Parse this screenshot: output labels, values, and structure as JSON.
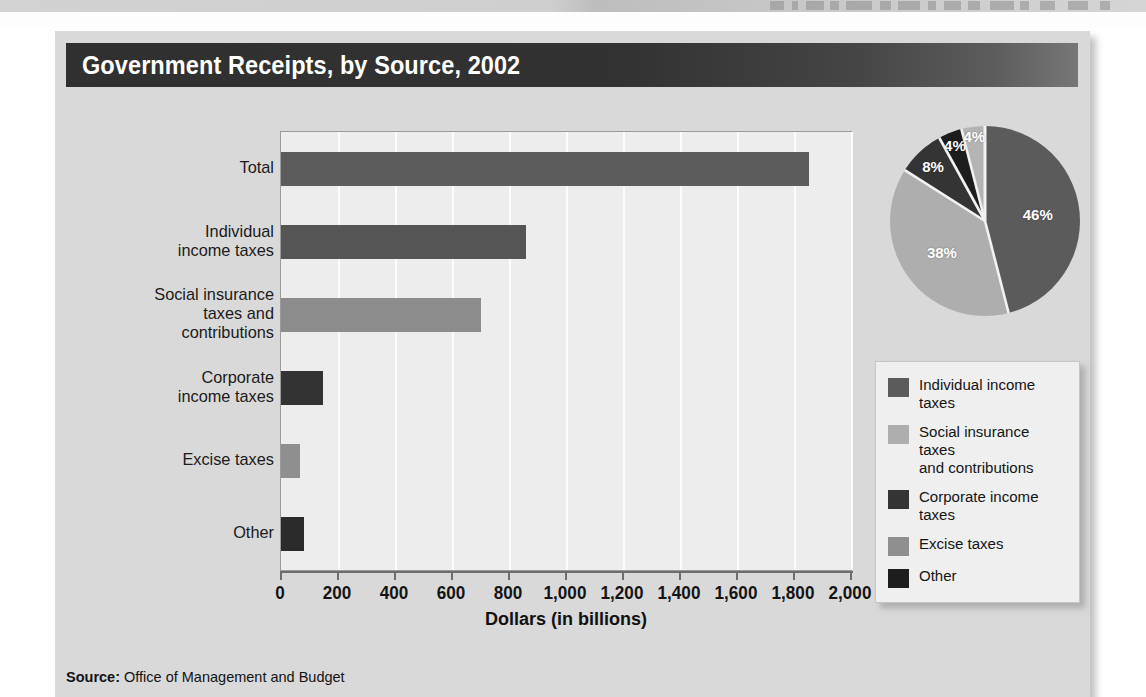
{
  "figure": {
    "title": "Government Receipts, by Source, 2002",
    "source_label": "Source:",
    "source_text": "Office of Management and Budget"
  },
  "chart_data": [
    {
      "type": "bar",
      "orientation": "horizontal",
      "title": "Government Receipts, by Source, 2002",
      "xlabel": "Dollars (in billions)",
      "ylabel": "",
      "xlim": [
        0,
        2000
      ],
      "xticks": [
        0,
        200,
        400,
        600,
        800,
        1000,
        1200,
        1400,
        1600,
        1800,
        2000
      ],
      "xticklabels": [
        "0",
        "200",
        "400",
        "600",
        "800",
        "1,000",
        "1,200",
        "1,400",
        "1,600",
        "1,800",
        "2,000"
      ],
      "grid": true,
      "categories": [
        "Total",
        "Individual\nincome taxes",
        "Social insurance\ntaxes and\ncontributions",
        "Corporate\nincome taxes",
        "Excise taxes",
        "Other"
      ],
      "values": [
        1853,
        858,
        701,
        148,
        67,
        79
      ],
      "colors": [
        "#5c5c5c",
        "#555555",
        "#8c8c8c",
        "#333333",
        "#8f8f8f",
        "#2b2b2b"
      ]
    },
    {
      "type": "pie",
      "title": "",
      "labels": [
        "Individual income taxes",
        "Social insurance taxes and contributions",
        "Corporate income taxes",
        "Other",
        "Excise taxes"
      ],
      "values": [
        46,
        38,
        8,
        4,
        4
      ],
      "datalabels": [
        "46%",
        "38%",
        "8%",
        "4%",
        "4%"
      ],
      "colors": [
        "#5b5b5b",
        "#aeaeae",
        "#343434",
        "#1d1d1d",
        "#b4b4b4"
      ],
      "startangle": 90,
      "counterclock": false
    }
  ],
  "legend": {
    "position": "right",
    "entries": [
      {
        "label": "Individual income taxes",
        "color": "#5b5b5b"
      },
      {
        "label": "Social insurance taxes\nand contributions",
        "color": "#aeaeae"
      },
      {
        "label": "Corporate income taxes",
        "color": "#343434"
      },
      {
        "label": "Excise taxes",
        "color": "#8f8f8f"
      },
      {
        "label": "Other",
        "color": "#1d1d1d"
      }
    ]
  }
}
